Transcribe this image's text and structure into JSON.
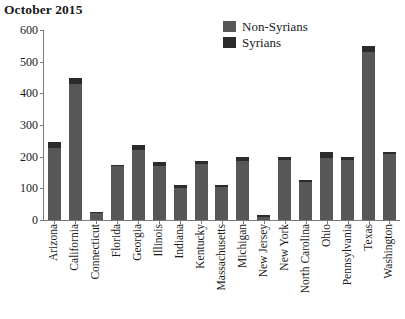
{
  "chart_data": {
    "type": "bar",
    "title": "October 2015",
    "xlabel": "",
    "ylabel": "",
    "ylim": [
      0,
      600
    ],
    "yticks": [
      0,
      100,
      200,
      300,
      400,
      500,
      600
    ],
    "grid": false,
    "legend_position": "top-right",
    "stacked": true,
    "categories": [
      "Arizona",
      "California",
      "Connecticut",
      "Florida",
      "Georgia",
      "Illinois",
      "Indiana",
      "Kentucky",
      "Massachusetts",
      "Michigan",
      "New Jersey",
      "New York",
      "North Carolina",
      "Ohio",
      "Pennsylvania",
      "Texas",
      "Washington"
    ],
    "series": [
      {
        "name": "Non-Syrians",
        "color": "#575757",
        "values": [
          228,
          428,
          21,
          170,
          220,
          172,
          102,
          176,
          104,
          186,
          11,
          190,
          119,
          196,
          188,
          530,
          210
        ]
      },
      {
        "name": "Syrians",
        "color": "#2b2b2b",
        "values": [
          17,
          19,
          4,
          5,
          17,
          10,
          10,
          10,
          6,
          12,
          4,
          10,
          6,
          19,
          12,
          18,
          5
        ]
      }
    ],
    "totals": [
      245,
      447,
      25,
      175,
      237,
      182,
      112,
      186,
      110,
      198,
      15,
      200,
      125,
      215,
      200,
      548,
      215
    ]
  },
  "colors": {
    "non_syrians": "#575757",
    "syrians": "#2b2b2b",
    "axis": "#7a7a7a",
    "text": "#1a1a1a",
    "background": "#ffffff"
  }
}
